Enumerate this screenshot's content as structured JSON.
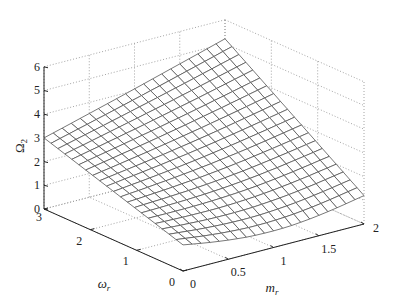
{
  "chart_data": {
    "type": "surface",
    "title": "",
    "xlabel": "m_r",
    "ylabel": "ω_r",
    "zlabel": "Ω_2",
    "xlabel_display": {
      "main": "m",
      "sub": "r"
    },
    "ylabel_display": {
      "main": "ω",
      "sub": "r"
    },
    "zlabel_display": {
      "main": "Ω",
      "sub": "2"
    },
    "xlim": [
      0,
      2
    ],
    "ylim": [
      0,
      3
    ],
    "zlim": [
      0,
      6
    ],
    "x_ticks": [
      0,
      0.5,
      1,
      1.5,
      2
    ],
    "x_tick_labels": [
      "0",
      "0.5",
      "1",
      "1.5",
      "2"
    ],
    "y_ticks": [
      0,
      1,
      2,
      3
    ],
    "y_tick_labels": [
      "0",
      "1",
      "2",
      "3"
    ],
    "z_ticks": [
      0,
      1,
      2,
      3,
      4,
      5,
      6
    ],
    "z_tick_labels": [
      "0",
      "1",
      "2",
      "3",
      "4",
      "5",
      "6"
    ],
    "grid": true,
    "grid_style": "dotted",
    "mesh_color": "#555555",
    "mesh_resolution": {
      "m_steps": 20,
      "omega_steps": 20
    },
    "surface_corners": [
      {
        "m": 0,
        "omega": 0,
        "z": 1.1
      },
      {
        "m": 2,
        "omega": 0,
        "z": 1.2
      },
      {
        "m": 0,
        "omega": 3,
        "z": 3.0
      },
      {
        "m": 2,
        "omega": 3,
        "z": 5.2
      }
    ],
    "surface_model": {
      "description": "z = a + b*m + c*omega + d*m*omega - dip*sin(pi*m/2)*exp(-omega)",
      "a": 1.1,
      "b": 0.05,
      "c": 0.633,
      "d": 0.35,
      "dip": 0.45
    }
  }
}
